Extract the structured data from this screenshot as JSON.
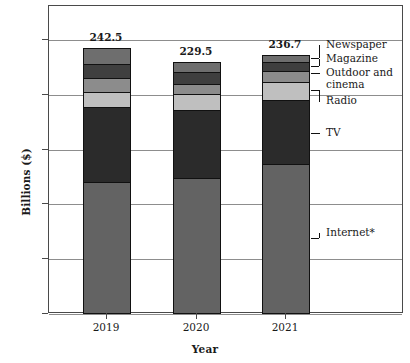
{
  "chart_data": {
    "type": "bar",
    "subtype": "stacked-vertical",
    "title": "",
    "xlabel": "Year",
    "ylabel": "Billions ($)",
    "categories": [
      "2019",
      "2020",
      "2021"
    ],
    "ylim": [
      0,
      250
    ],
    "yticks": [
      0,
      50,
      100,
      150,
      200,
      250
    ],
    "ytick_labels": [
      "0",
      "50",
      "100",
      "150",
      "200",
      "250"
    ],
    "grid": true,
    "grid_axis": "y",
    "legend_position": "right-callouts",
    "totals": [
      242.5,
      229.5,
      236.7
    ],
    "total_labels": [
      "242.5",
      "229.5",
      "236.7"
    ],
    "series": [
      {
        "name": "Internet*",
        "color": "#636363",
        "values": [
          120.0,
          124.5,
          137.0
        ]
      },
      {
        "name": "TV",
        "color": "#2b2b2b",
        "values": [
          68.5,
          62.0,
          58.5
        ]
      },
      {
        "name": "Radio",
        "color": "#bfbfbf",
        "values": [
          14.5,
          14.0,
          16.5
        ]
      },
      {
        "name": "Outdoor and cinema",
        "color": "#8c8c8c",
        "values": [
          12.0,
          9.5,
          10.0
        ]
      },
      {
        "name": "Magazine",
        "color": "#3f3f3f",
        "values": [
          13.5,
          10.5,
          7.5
        ]
      },
      {
        "name": "Newspaper",
        "color": "#6e6e6e",
        "values": [
          14.0,
          9.0,
          7.2
        ]
      }
    ],
    "callouts": [
      {
        "label": "Newspaper",
        "series": "Newspaper"
      },
      {
        "label": "Magazine",
        "series": "Magazine"
      },
      {
        "label": "Outdoor and",
        "label2": "cinema",
        "series": "Outdoor and cinema"
      },
      {
        "label": "Radio",
        "series": "Radio"
      },
      {
        "label": "TV",
        "series": "TV"
      },
      {
        "label": "Internet*",
        "series": "Internet*"
      }
    ],
    "colors": {
      "internet": "#636363",
      "tv": "#2b2b2b",
      "radio": "#bfbfbf",
      "outdoor": "#8c8c8c",
      "magazine": "#3f3f3f",
      "newspaper": "#6e6e6e",
      "grid": "#8d8d8d",
      "frame": "#4a4a4a",
      "text": "#111111"
    }
  }
}
